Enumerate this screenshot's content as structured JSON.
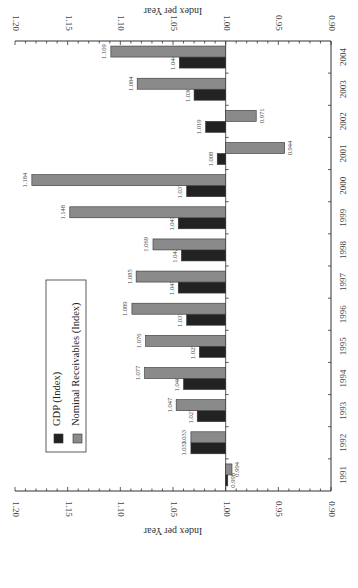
{
  "chart_data": {
    "type": "bar",
    "orientation": "rotated 90° (vertical text, bars extend horizontally)",
    "title": "",
    "ylabel": "Index per Year",
    "xlabel": "",
    "ylim": [
      0.9,
      1.2
    ],
    "yticks": [
      "1.20",
      "1.15",
      "1.10",
      "1.05",
      "1.00",
      "0.95",
      "0.90"
    ],
    "baseline": 1.0,
    "categories": [
      "1991",
      "1992",
      "1993",
      "1994",
      "1995",
      "1996",
      "1997",
      "1998",
      "1999",
      "2000",
      "2001",
      "2002",
      "2003",
      "2004"
    ],
    "series": [
      {
        "name": "GDP (Index)",
        "color": "#222222",
        "values": [
          0.998,
          1.033,
          1.027,
          1.04,
          1.025,
          1.037,
          1.045,
          1.042,
          1.045,
          1.037,
          1.008,
          1.019,
          1.03,
          1.044
        ],
        "labels": [
          "0.998",
          "1.033",
          "1.027",
          "1.040",
          "1.025",
          "1.037",
          "1.045",
          "1.042",
          "1.045",
          "1.037",
          "1.008",
          "1.019",
          "1.030",
          "1.044"
        ]
      },
      {
        "name": "Nominal Receivables (Index)",
        "color": "#8a8a8a",
        "values": [
          0.994,
          1.033,
          1.047,
          1.077,
          1.076,
          1.089,
          1.085,
          1.069,
          1.148,
          1.184,
          0.944,
          0.971,
          1.084,
          1.109
        ],
        "labels": [
          "0.994",
          "1.033",
          "1.047",
          "1.077",
          "1.076",
          "1.089",
          "1.085",
          "1.069",
          "1.148",
          "1.184",
          "0.944",
          "0.971",
          "1.084",
          "1.109"
        ]
      }
    ],
    "legend": {
      "position": "upper-left (rotated)",
      "entries": [
        "GDP (Index)",
        "Nominal Receivables (Index)"
      ]
    },
    "grid": false
  }
}
